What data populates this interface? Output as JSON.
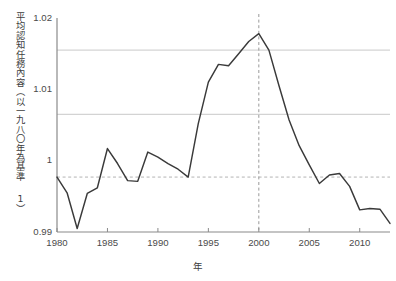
{
  "chart_data": {
    "type": "line",
    "title": "",
    "xlabel": "年",
    "ylabel": "平均認知任務內容（以一九八〇年為基準 1）",
    "x": [
      1980,
      1981,
      1982,
      1983,
      1984,
      1985,
      1986,
      1987,
      1988,
      1989,
      1990,
      1991,
      1992,
      1993,
      1994,
      1995,
      1996,
      1997,
      1998,
      1999,
      2000,
      2001,
      2002,
      2003,
      2004,
      2005,
      2006,
      2007,
      2008,
      2009,
      2010,
      2011,
      2012,
      2013
    ],
    "values": [
      0.9977,
      0.9955,
      0.9905,
      0.9954,
      0.9962,
      1.0017,
      0.9996,
      0.9972,
      0.9971,
      1.0012,
      1.0005,
      0.9996,
      0.9988,
      0.9977,
      1.0052,
      1.011,
      1.0135,
      1.0133,
      1.015,
      1.0167,
      1.0178,
      1.0155,
      1.0105,
      1.0057,
      1.0021,
      0.9994,
      0.9968,
      0.998,
      0.9982,
      0.9964,
      0.9931,
      0.9933,
      0.9932,
      0.9912
    ],
    "xlim": [
      1980,
      2013
    ],
    "ylim": [
      0.99,
      1.02
    ],
    "yticks": [
      0.99,
      1,
      1.01,
      1.02
    ],
    "ytick_labels": [
      "0.99",
      "1",
      "1.01",
      "1.02"
    ],
    "xticks": [
      1980,
      1985,
      1990,
      1995,
      2000,
      2005,
      2010
    ],
    "xtick_labels": [
      "1980",
      "1985",
      "1990",
      "1995",
      "2000",
      "2005",
      "2010"
    ],
    "gridlines_y": [
      1.0065,
      1.0155
    ],
    "grid": true,
    "legend": "none",
    "series_color": "#3a3a3a",
    "grid_color": "#c9c9c9",
    "axis_color": "#8a8a8a",
    "reference_lines": [
      {
        "name": "baseline-1980",
        "orientation": "horizontal",
        "value": 0.9977,
        "style": "dashed",
        "color": "#b4b4b4"
      },
      {
        "name": "year-2000-marker",
        "orientation": "vertical",
        "value": 2000,
        "style": "dashed",
        "color": "#9a9a9a"
      }
    ]
  }
}
